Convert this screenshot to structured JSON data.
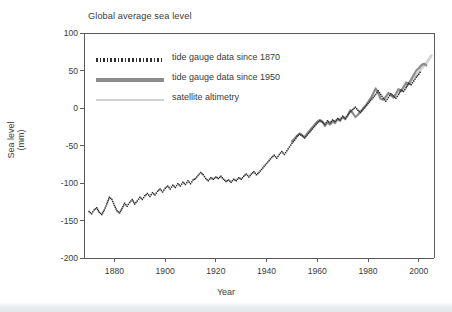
{
  "chart_data": {
    "type": "line",
    "title": "Global average sea level",
    "xlabel": "Year",
    "ylabel_line1": "Sea level",
    "ylabel_line2": "(mm)",
    "xlim": [
      1868,
      2006
    ],
    "ylim": [
      -200,
      100
    ],
    "xticks": [
      1880,
      1900,
      1920,
      1940,
      1960,
      1980,
      2000
    ],
    "yticks": [
      100,
      50,
      0,
      -50,
      -100,
      -150,
      -200
    ],
    "xtick_labels": [
      "1880",
      "1900",
      "1920",
      "1940",
      "1960",
      "1980",
      "2000"
    ],
    "ytick_labels": [
      "100",
      "50",
      "0",
      "-50",
      "-100",
      "-150",
      "-200"
    ],
    "grid": false,
    "legend_position": "upper-left-inside",
    "colors": {
      "tide_1870": "#2e2e2e",
      "tide_1950": "#8c8c8c",
      "satellite": "#d2d2d2",
      "axis": "#5a5a5a",
      "text": "#3a3a3a",
      "background": "#ffffff"
    },
    "series": [
      {
        "name": "tide gauge data since 1870",
        "style": "dotted",
        "color": "#2e2e2e",
        "x": [
          1870,
          1871,
          1872,
          1873,
          1874,
          1875,
          1876,
          1877,
          1878,
          1879,
          1880,
          1881,
          1882,
          1883,
          1884,
          1885,
          1886,
          1887,
          1888,
          1889,
          1890,
          1891,
          1892,
          1893,
          1894,
          1895,
          1896,
          1897,
          1898,
          1899,
          1900,
          1901,
          1902,
          1903,
          1904,
          1905,
          1906,
          1907,
          1908,
          1909,
          1910,
          1911,
          1912,
          1913,
          1914,
          1915,
          1916,
          1917,
          1918,
          1919,
          1920,
          1921,
          1922,
          1923,
          1924,
          1925,
          1926,
          1927,
          1928,
          1929,
          1930,
          1931,
          1932,
          1933,
          1934,
          1935,
          1936,
          1937,
          1938,
          1939,
          1940,
          1941,
          1942,
          1943,
          1944,
          1945,
          1946,
          1947,
          1948,
          1949,
          1950,
          1951,
          1952,
          1953,
          1954,
          1955,
          1956,
          1957,
          1958,
          1959,
          1960,
          1961,
          1962,
          1963,
          1964,
          1965,
          1966,
          1967,
          1968,
          1969,
          1970,
          1971,
          1972,
          1973,
          1974,
          1975,
          1976,
          1977,
          1978,
          1979,
          1980,
          1981,
          1982,
          1983,
          1984,
          1985,
          1986,
          1987,
          1988,
          1989,
          1990,
          1991,
          1992,
          1993,
          1994,
          1995,
          1996,
          1997,
          1998,
          1999,
          2000,
          2001
        ],
        "y": [
          -138,
          -141,
          -136,
          -133,
          -139,
          -142,
          -136,
          -128,
          -119,
          -122,
          -130,
          -137,
          -140,
          -134,
          -127,
          -131,
          -126,
          -122,
          -128,
          -124,
          -119,
          -122,
          -117,
          -114,
          -118,
          -113,
          -116,
          -111,
          -108,
          -112,
          -107,
          -104,
          -108,
          -103,
          -106,
          -101,
          -104,
          -99,
          -102,
          -97,
          -101,
          -96,
          -94,
          -90,
          -86,
          -89,
          -94,
          -97,
          -93,
          -95,
          -92,
          -94,
          -91,
          -95,
          -98,
          -96,
          -99,
          -95,
          -97,
          -93,
          -95,
          -91,
          -88,
          -92,
          -88,
          -85,
          -89,
          -86,
          -82,
          -78,
          -74,
          -70,
          -66,
          -63,
          -67,
          -62,
          -58,
          -62,
          -57,
          -52,
          -47,
          -43,
          -38,
          -35,
          -37,
          -40,
          -36,
          -32,
          -28,
          -24,
          -20,
          -17,
          -19,
          -22,
          -17,
          -20,
          -16,
          -18,
          -14,
          -16,
          -11,
          -14,
          -9,
          -5,
          -2,
          1,
          -3,
          -6,
          -2,
          2,
          6,
          10,
          14,
          18,
          23,
          18,
          13,
          9,
          14,
          19,
          16,
          13,
          18,
          24,
          22,
          27,
          33,
          31,
          36,
          41,
          45,
          50
        ]
      },
      {
        "name": "tide gauge data since 1950",
        "style": "solid",
        "color": "#8c8c8c",
        "x": [
          1950,
          1951,
          1952,
          1953,
          1954,
          1955,
          1956,
          1957,
          1958,
          1959,
          1960,
          1961,
          1962,
          1963,
          1964,
          1965,
          1966,
          1967,
          1968,
          1969,
          1970,
          1971,
          1972,
          1973,
          1974,
          1975,
          1976,
          1977,
          1978,
          1979,
          1980,
          1981,
          1982,
          1983,
          1984,
          1985,
          1986,
          1987,
          1988,
          1989,
          1990,
          1991,
          1992,
          1993,
          1994,
          1995,
          1996,
          1997,
          1998,
          1999,
          2000,
          2001,
          2002,
          2003
        ],
        "y": [
          -44,
          -41,
          -37,
          -34,
          -36,
          -39,
          -34,
          -30,
          -26,
          -22,
          -18,
          -16,
          -18,
          -24,
          -19,
          -22,
          -18,
          -20,
          -15,
          -17,
          -12,
          -15,
          -10,
          -3,
          -7,
          -12,
          -9,
          -5,
          -1,
          3,
          8,
          13,
          19,
          26,
          20,
          12,
          11,
          15,
          20,
          17,
          14,
          19,
          25,
          23,
          28,
          34,
          32,
          38,
          44,
          50,
          53,
          57,
          59,
          57
        ]
      },
      {
        "name": "satellite altimetry",
        "style": "solid-thin",
        "color": "#d2d2d2",
        "x": [
          1993,
          1994,
          1995,
          1996,
          1997,
          1998,
          1999,
          2000,
          2001,
          2002,
          2003,
          2004,
          2005
        ],
        "y": [
          22,
          26,
          29,
          33,
          36,
          41,
          44,
          48,
          52,
          56,
          60,
          65,
          70
        ]
      }
    ]
  },
  "plot_geometry": {
    "left": 84,
    "right": 434,
    "top": 33,
    "bottom": 258
  },
  "legend": {
    "items": [
      {
        "label": "tide gauge data since 1870",
        "sample": "dotted-line-sample"
      },
      {
        "label": "tide gauge data since 1950",
        "sample": "solid-gray-line-sample"
      },
      {
        "label": "satellite altimetry",
        "sample": "light-gray-line-sample"
      }
    ]
  }
}
